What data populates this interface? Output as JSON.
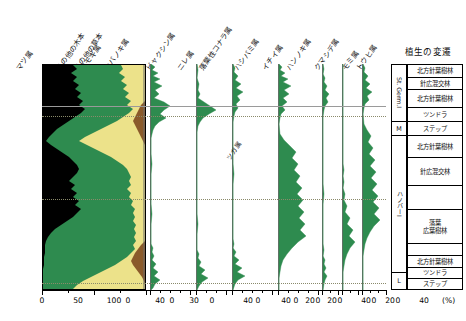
{
  "chart_data": {
    "type": "area",
    "title": "",
    "xlabel": "(%)",
    "ylabel": "",
    "grid": false,
    "orientation": "vertical-depth-profile",
    "legend": "none",
    "note_inline": "ツガ属",
    "percent_symbol": "(%)",
    "depth_axis": {
      "top": 0,
      "bottom": 226,
      "units": "relative depth (unlabelled)"
    },
    "zone_boundaries_y": [
      106,
      116,
      199,
      281
    ],
    "stacked_column": {
      "label": "main stacked percentage column",
      "categories": [
        "マツ属",
        "その他の木本",
        "その他の草本",
        "ヨモギ属"
      ],
      "colors": [
        "#000000",
        "#2e8b4f",
        "#ece28a",
        "#8a5a2b"
      ],
      "xlim": [
        0,
        100
      ],
      "ticks": [
        0,
        50,
        100
      ]
    },
    "series": [
      {
        "name": "マツ属",
        "color": "#000000",
        "xlim": [
          0,
          100
        ],
        "ticks": [
          0,
          50,
          100
        ]
      },
      {
        "name": "その他の木本",
        "color": "#2e8b4f",
        "xlim": [
          0,
          100
        ],
        "ticks": [
          0,
          50,
          100
        ]
      },
      {
        "name": "その他の草本",
        "color": "#ece28a",
        "xlim": [
          0,
          100
        ],
        "ticks": [
          0,
          50,
          100
        ]
      },
      {
        "name": "ヨモギ属",
        "color": "#8a5a2b",
        "xlim": [
          0,
          100
        ],
        "ticks": [
          0,
          50,
          100
        ]
      },
      {
        "name": "カバノキ属",
        "color": "#2e8b4f",
        "xlim": [
          0,
          40
        ],
        "ticks": [
          0,
          40
        ]
      },
      {
        "name": "ビャクシン属",
        "color": "#2e8b4f",
        "xlim": [
          0,
          30
        ],
        "ticks": [
          0,
          30
        ]
      },
      {
        "name": "ニレ属",
        "color": "#2e8b4f",
        "xlim": [
          0,
          40
        ],
        "ticks": [
          0,
          40
        ]
      },
      {
        "name": "落葉性コナラ属",
        "color": "#2e8b4f",
        "xlim": [
          0,
          40
        ],
        "ticks": [
          0,
          40
        ]
      },
      {
        "name": "ハシバミ属",
        "color": "#2e8b4f",
        "xlim": [
          0,
          20
        ],
        "ticks": [
          0,
          20
        ]
      },
      {
        "name": "イチイ属",
        "color": "#2e8b4f",
        "xlim": [
          0,
          20
        ],
        "ticks": [
          0,
          20
        ]
      },
      {
        "name": "ハンノキ属",
        "color": "#2e8b4f",
        "xlim": [
          0,
          40
        ],
        "ticks": [
          0,
          40
        ]
      },
      {
        "name": "クマシデ属",
        "color": "#2e8b4f",
        "xlim": [
          0,
          20
        ],
        "ticks": [
          0,
          20
        ]
      },
      {
        "name": "モミ属",
        "color": "#2e8b4f",
        "xlim": [
          0,
          40
        ],
        "ticks": [
          0,
          40
        ]
      },
      {
        "name": "トウヒ属",
        "color": "#2e8b4f",
        "xlim": [
          0,
          40
        ],
        "ticks": [
          0,
          40
        ]
      }
    ]
  },
  "headers": [
    {
      "text": "マツ属",
      "x": 22,
      "y": 62
    },
    {
      "text": "その他の木本",
      "x": 62,
      "y": 62
    },
    {
      "text": "その他の草本",
      "x": 80,
      "y": 62
    },
    {
      "text": "ヨモギ属",
      "x": 86,
      "y": 62
    },
    {
      "text": "カバノキ属",
      "x": 110,
      "y": 62
    },
    {
      "text": "ビャクシン属",
      "x": 152,
      "y": 62
    },
    {
      "text": "ニレ属",
      "x": 183,
      "y": 62
    },
    {
      "text": "落葉性コナラ属",
      "x": 205,
      "y": 62
    },
    {
      "text": "ハシバミ属",
      "x": 240,
      "y": 62
    },
    {
      "text": "イチイ属",
      "x": 268,
      "y": 62
    },
    {
      "text": "ハンノキ属",
      "x": 292,
      "y": 62
    },
    {
      "text": "クマシデ属",
      "x": 320,
      "y": 62
    },
    {
      "text": "モミ属",
      "x": 348,
      "y": 62
    },
    {
      "text": "トウヒ属",
      "x": 362,
      "y": 62
    }
  ],
  "inline_label": {
    "text": "ツガ属",
    "x": 232,
    "y": 152
  },
  "axis": {
    "percent_label": "(%)",
    "groups": [
      {
        "left": 42,
        "width": 104,
        "labels": [
          {
            "v": "0",
            "px": 0
          },
          {
            "v": "50",
            "px": 52
          },
          {
            "v": "100",
            "px": 104
          }
        ]
      },
      {
        "left": 152,
        "width": 40,
        "labels": [
          {
            "v": "0",
            "px": 0
          },
          {
            "v": "40",
            "px": 40
          }
        ]
      },
      {
        "left": 198,
        "width": 30,
        "labels": [
          {
            "v": "0",
            "px": 0
          },
          {
            "v": "30",
            "px": 30
          }
        ]
      },
      {
        "left": 236,
        "width": 40,
        "labels": [
          {
            "v": "0",
            "px": 0
          },
          {
            "v": "40",
            "px": 40
          }
        ]
      },
      {
        "left": 282,
        "width": 40,
        "labels": [
          {
            "v": "0",
            "px": 0
          },
          {
            "v": "40",
            "px": 40
          }
        ]
      },
      {
        "left": 246,
        "width": 0,
        "labels": []
      }
    ]
  },
  "axis_ticks": [
    {
      "x": 42,
      "label": "0",
      "major": true
    },
    {
      "x": 68,
      "label": "",
      "major": false
    },
    {
      "x": 94,
      "label": "50",
      "major": true
    },
    {
      "x": 120,
      "label": "",
      "major": false
    },
    {
      "x": 146,
      "label": "100",
      "major": true
    },
    {
      "x": 150,
      "label": "0",
      "major": true
    },
    {
      "x": 160,
      "label": "",
      "major": false
    },
    {
      "x": 170,
      "label": "",
      "major": false
    },
    {
      "x": 180,
      "label": "",
      "major": false
    },
    {
      "x": 190,
      "label": "40",
      "major": true
    },
    {
      "x": 196,
      "label": "0",
      "major": true
    },
    {
      "x": 206,
      "label": "",
      "major": false
    },
    {
      "x": 216,
      "label": "",
      "major": false
    },
    {
      "x": 226,
      "label": "30",
      "major": true
    },
    {
      "x": 232,
      "label": "0",
      "major": true
    },
    {
      "x": 242,
      "label": "",
      "major": false
    },
    {
      "x": 252,
      "label": "",
      "major": false
    },
    {
      "x": 262,
      "label": "",
      "major": false
    },
    {
      "x": 272,
      "label": "40",
      "major": true
    },
    {
      "x": 278,
      "label": "0",
      "major": true
    },
    {
      "x": 288,
      "label": "",
      "major": false
    },
    {
      "x": 298,
      "label": "",
      "major": false
    },
    {
      "x": 308,
      "label": "",
      "major": false
    },
    {
      "x": 318,
      "label": "40",
      "major": true
    },
    {
      "x": 322,
      "label": "0",
      "major": true
    },
    {
      "x": 330,
      "label": "",
      "major": false
    },
    {
      "x": 338,
      "label": "20",
      "major": true
    },
    {
      "x": 342,
      "label": "0",
      "major": true
    },
    {
      "x": 350,
      "label": "",
      "major": false
    },
    {
      "x": 358,
      "label": "20",
      "major": true
    },
    {
      "x": 362,
      "label": "0",
      "major": true
    },
    {
      "x": 370,
      "label": "",
      "major": false
    },
    {
      "x": 378,
      "label": "",
      "major": false
    },
    {
      "x": 386,
      "label": "40",
      "major": true
    }
  ],
  "axis_labels": [
    {
      "x": 42,
      "text": "0"
    },
    {
      "x": 78,
      "text": "50"
    },
    {
      "x": 114,
      "text": "100"
    },
    {
      "x": 128,
      "text": "0"
    },
    {
      "x": 160,
      "text": "40"
    },
    {
      "x": 172,
      "text": "0"
    },
    {
      "x": 194,
      "text": "30"
    },
    {
      "x": 212,
      "text": "0"
    },
    {
      "x": 248,
      "text": "40"
    },
    {
      "x": 258,
      "text": "0"
    },
    {
      "x": 286,
      "text": "40"
    },
    {
      "x": 296,
      "text": "0"
    },
    {
      "x": 310,
      "text": "20"
    },
    {
      "x": 318,
      "text": "0"
    },
    {
      "x": 332,
      "text": "20"
    },
    {
      "x": 340,
      "text": "0"
    },
    {
      "x": 366,
      "text": "40"
    },
    {
      "x": 374,
      "text": "0"
    },
    {
      "x": 390,
      "text": "20"
    },
    {
      "x": 398,
      "text": "0"
    },
    {
      "x": 424,
      "text": "40"
    },
    {
      "x": 442,
      "text": "(%)"
    }
  ],
  "vegetation_panel": {
    "title": "植生の変遷",
    "group_labels": [
      {
        "text": "St. Germ.I",
        "top": 0,
        "height": 58,
        "vertical": true
      },
      {
        "text": "M",
        "top": 58,
        "height": 14,
        "vertical": false
      },
      {
        "text": "ハノバーI",
        "top": 72,
        "height": 137,
        "vertical": true
      },
      {
        "text": "L",
        "top": 209,
        "height": 17,
        "vertical": false
      }
    ],
    "rows": [
      {
        "text": "北方針葉樹林",
        "top": 0,
        "height": 14
      },
      {
        "text": "針広混交林",
        "top": 14,
        "height": 12
      },
      {
        "text": "北方針葉樹林",
        "top": 26,
        "height": 18
      },
      {
        "text": "ツンドラ",
        "top": 44,
        "height": 14
      },
      {
        "text": "ステップ",
        "top": 58,
        "height": 14
      },
      {
        "text": "北方針葉樹林",
        "top": 72,
        "height": 22
      },
      {
        "text": "針広混交林",
        "top": 94,
        "height": 28
      },
      {
        "text": "",
        "top": 122,
        "height": 24
      },
      {
        "text": "落葉\n広葉樹林",
        "top": 146,
        "height": 34
      },
      {
        "text": "",
        "top": 180,
        "height": 12
      },
      {
        "text": "北方針葉樹林",
        "top": 192,
        "height": 12
      },
      {
        "text": "ツンドラ",
        "top": 204,
        "height": 11
      },
      {
        "text": "ステップ",
        "top": 215,
        "height": 11
      }
    ]
  }
}
